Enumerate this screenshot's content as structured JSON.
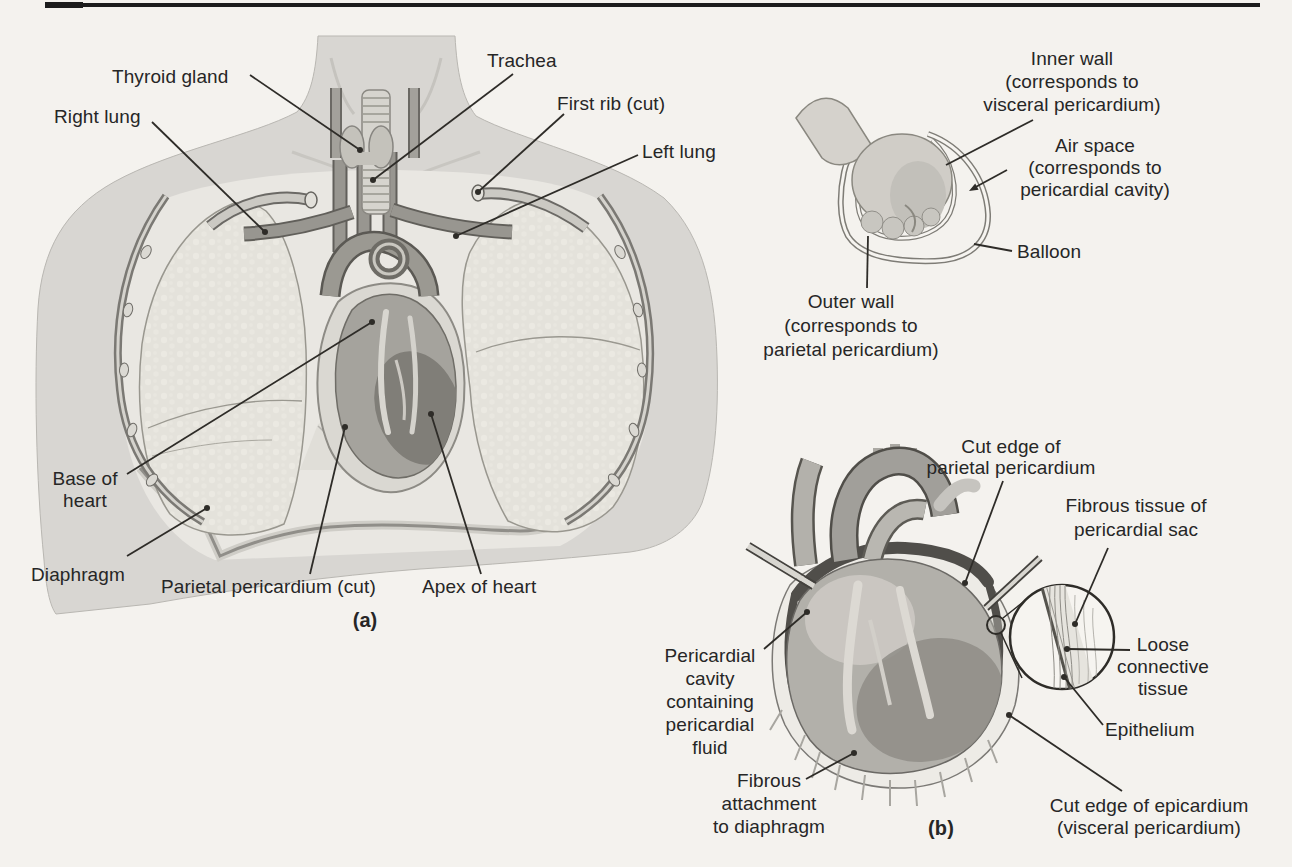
{
  "figure": {
    "panel_a": {
      "caption": "(a)",
      "labels": {
        "thyroid_gland": "Thyroid gland",
        "trachea": "Trachea",
        "first_rib": "First rib (cut)",
        "right_lung": "Right lung",
        "left_lung": "Left lung",
        "base_of_heart": "Base of\nheart",
        "diaphragm": "Diaphragm",
        "parietal_pericardium": "Parietal pericardium (cut)",
        "apex_of_heart": "Apex of heart"
      }
    },
    "balloon_inset": {
      "labels": {
        "inner_wall": "Inner wall\n(corresponds to\nvisceral pericardium)",
        "air_space": "Air space\n(corresponds to\npericardial cavity)",
        "balloon": "Balloon",
        "outer_wall": "Outer wall\n(corresponds to\nparietal pericardium)"
      }
    },
    "panel_b": {
      "caption": "(b)",
      "labels": {
        "cut_edge_parietal_pericardium": "Cut edge of\nparietal pericardium",
        "fibrous_tissue_of_pericardial_sac": "Fibrous tissue of\npericardial sac",
        "loose_connective_tissue": "Loose\nconnective\ntissue",
        "epithelium": "Epithelium",
        "pericardial_cavity": "Pericardial\ncavity\ncontaining\npericardial\nfluid",
        "fibrous_attachment": "Fibrous\nattachment\nto diaphragm",
        "cut_edge_epicardium": "Cut edge of epicardium\n(visceral pericardium)"
      }
    },
    "colors": {
      "page_background": "#f4f2ee",
      "top_rule": "#1c1c1c",
      "label_text": "#262626",
      "leader_line": "#2e2c28"
    }
  }
}
